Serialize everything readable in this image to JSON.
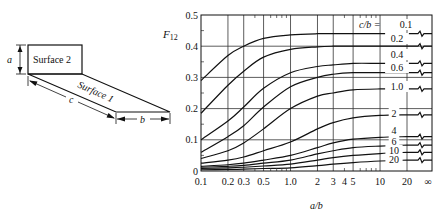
{
  "diagram": {
    "surface2_label": "Surface 2",
    "surface1_label": "Surface 1",
    "dim_a": "a",
    "dim_b": "b",
    "dim_c": "c"
  },
  "chart_data": {
    "type": "line",
    "title": "",
    "ylabel": "F12",
    "ylabel_main": "F",
    "ylabel_sub": "12",
    "xlabel": "a/b",
    "xscale": "log",
    "xlim": [
      0.1,
      30
    ],
    "ylim": [
      0,
      0.5
    ],
    "grid": true,
    "x_tick_labels": [
      "0.1",
      "0.2",
      "0.3",
      "0.5",
      "1.0",
      "2",
      "3",
      "4",
      "5",
      "10",
      "20",
      "∞"
    ],
    "y_tick_labels": [
      "0",
      "0.1",
      "0.2",
      "0.3",
      "0.4",
      "0.5"
    ],
    "legend_title": "c/b =",
    "legend_position": "right, inline labels",
    "x": [
      0.1,
      0.2,
      0.3,
      0.5,
      1.0,
      2,
      3,
      5,
      10,
      20,
      "∞"
    ],
    "series": [
      {
        "name": "0.1",
        "label": "c/b = 0.1",
        "values": [
          0.29,
          0.37,
          0.4,
          0.425,
          0.436,
          0.44,
          0.44,
          0.44,
          0.44,
          0.44,
          0.44
        ]
      },
      {
        "name": "0.2",
        "label": "0.2",
        "values": [
          0.185,
          0.275,
          0.32,
          0.365,
          0.39,
          0.398,
          0.4,
          0.4,
          0.4,
          0.4,
          0.4
        ]
      },
      {
        "name": "0.4",
        "label": "0.4",
        "values": [
          0.1,
          0.16,
          0.205,
          0.265,
          0.315,
          0.335,
          0.34,
          0.345,
          0.345,
          0.345,
          0.345
        ]
      },
      {
        "name": "0.6",
        "label": "0.6",
        "values": [
          0.06,
          0.11,
          0.145,
          0.205,
          0.27,
          0.3,
          0.31,
          0.315,
          0.315,
          0.315,
          0.315
        ]
      },
      {
        "name": "1.0",
        "label": "1.0",
        "values": [
          0.04,
          0.065,
          0.09,
          0.135,
          0.2,
          0.24,
          0.25,
          0.26,
          0.263,
          0.263,
          0.263
        ]
      },
      {
        "name": "2",
        "label": "2",
        "values": [
          0.025,
          0.035,
          0.045,
          0.065,
          0.093,
          0.135,
          0.155,
          0.17,
          0.178,
          0.18,
          0.18
        ]
      },
      {
        "name": "4",
        "label": "4",
        "values": [
          0.015,
          0.02,
          0.025,
          0.035,
          0.05,
          0.075,
          0.09,
          0.102,
          0.108,
          0.11,
          0.11
        ]
      },
      {
        "name": "6",
        "label": "6",
        "values": [
          0.012,
          0.015,
          0.018,
          0.025,
          0.035,
          0.055,
          0.065,
          0.075,
          0.08,
          0.083,
          0.083
        ]
      },
      {
        "name": "10",
        "label": "10",
        "values": [
          0.008,
          0.01,
          0.012,
          0.016,
          0.022,
          0.035,
          0.043,
          0.05,
          0.056,
          0.06,
          0.06
        ]
      },
      {
        "name": "20",
        "label": "20",
        "values": [
          0.004,
          0.005,
          0.006,
          0.008,
          0.01,
          0.017,
          0.022,
          0.027,
          0.032,
          0.035,
          0.035
        ]
      }
    ]
  }
}
